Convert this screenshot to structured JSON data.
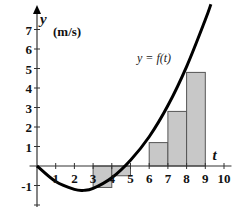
{
  "chart_data": {
    "type": "line",
    "title": "",
    "xlabel": "t",
    "ylabel": "y",
    "y_unit": "(m/s)",
    "curve_label": "y = f(t)",
    "xlim": [
      0,
      10
    ],
    "ylim": [
      -2,
      7.5
    ],
    "x_ticks": [
      1,
      2,
      3,
      4,
      5,
      6,
      7,
      8,
      9,
      10
    ],
    "y_ticks": [
      -1,
      1,
      2,
      3,
      4,
      5,
      6,
      7
    ],
    "grid": false,
    "curve": {
      "name": "f(t)",
      "points": [
        [
          0,
          0
        ],
        [
          1,
          -0.8
        ],
        [
          2,
          -1.2
        ],
        [
          2.5,
          -1.25
        ],
        [
          3,
          -1.15
        ],
        [
          4,
          -0.6
        ],
        [
          5,
          0.3
        ],
        [
          6,
          1.5
        ],
        [
          7,
          3.1
        ],
        [
          8,
          5.1
        ],
        [
          9,
          7.5
        ],
        [
          9.3,
          8.3
        ]
      ]
    },
    "rectangles": [
      {
        "x0": 3,
        "x1": 4,
        "height": -1.1
      },
      {
        "x0": 4,
        "x1": 5,
        "height": -0.5
      },
      {
        "x0": 6,
        "x1": 7,
        "height": 1.2
      },
      {
        "x0": 7,
        "x1": 8,
        "height": 2.8
      },
      {
        "x0": 8,
        "x1": 9,
        "height": 4.8
      }
    ],
    "colors": {
      "bar_fill": "#c8c8c8",
      "bar_stroke": "#555555",
      "curve": "#000000",
      "axis": "#333333"
    }
  }
}
